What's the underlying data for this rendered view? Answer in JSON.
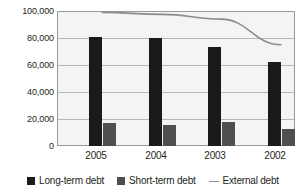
{
  "chart_data": {
    "type": "bar",
    "title": "",
    "subtitle": "",
    "xlabel": "",
    "ylabel": "",
    "categories": [
      "2005",
      "2004",
      "2003",
      "2002"
    ],
    "ylim": [
      0,
      100000
    ],
    "yticks": [
      0,
      20000,
      40000,
      60000,
      80000,
      100000
    ],
    "ytick_labels": [
      "0",
      "20,000",
      "40,000",
      "60,000",
      "80,000",
      "100,000"
    ],
    "grid": true,
    "legend_position": "bottom",
    "series": [
      {
        "name": "Long-term debt",
        "type": "bar",
        "color": "#1a1a1a",
        "values": [
          81000,
          80000,
          73000,
          62000
        ]
      },
      {
        "name": "Short-term debt",
        "type": "bar",
        "color": "#4f4f4f",
        "values": [
          17000,
          15500,
          17500,
          12500
        ]
      },
      {
        "name": "External debt",
        "type": "line",
        "color": "#8c8c8c",
        "values": [
          99000,
          97500,
          94000,
          75000
        ]
      }
    ]
  },
  "legend": {
    "items": [
      {
        "label": "Long-term debt",
        "marker": "square-dark-icon"
      },
      {
        "label": "Short-term debt",
        "marker": "square-grey-icon"
      },
      {
        "label": "External debt",
        "marker": "line-grey-icon"
      }
    ]
  },
  "y_axis": {
    "ticks": [
      {
        "label": "100,000"
      },
      {
        "label": "80,000"
      },
      {
        "label": "60,000"
      },
      {
        "label": "40,000"
      },
      {
        "label": "20,000"
      },
      {
        "label": "0"
      }
    ]
  },
  "x_axis": {
    "ticks": [
      {
        "label": "2005"
      },
      {
        "label": "2004"
      },
      {
        "label": "2003"
      },
      {
        "label": "2002"
      }
    ]
  }
}
